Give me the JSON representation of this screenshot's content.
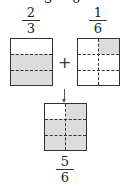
{
  "top_cropped_text": [
    "3",
    "6"
  ],
  "left": {
    "fraction": {
      "numerator": "2",
      "denominator": "3"
    },
    "rows": 3,
    "cols": 1,
    "shaded_cells": [
      [
        1,
        0
      ],
      [
        2,
        0
      ]
    ]
  },
  "operator": "+",
  "right": {
    "fraction": {
      "numerator": "1",
      "denominator": "6"
    },
    "rows": 3,
    "cols": 2,
    "shaded_cells": [
      [
        0,
        1
      ]
    ]
  },
  "arrow": "down-arrow",
  "result": {
    "fraction": {
      "numerator": "5",
      "denominator": "6"
    },
    "rows": 3,
    "cols": 2,
    "shaded_cells": [
      [
        0,
        1
      ],
      [
        1,
        0
      ],
      [
        1,
        1
      ],
      [
        2,
        0
      ],
      [
        2,
        1
      ]
    ]
  },
  "colors": {
    "shade": "#dcdcdc",
    "line": "#333333"
  }
}
